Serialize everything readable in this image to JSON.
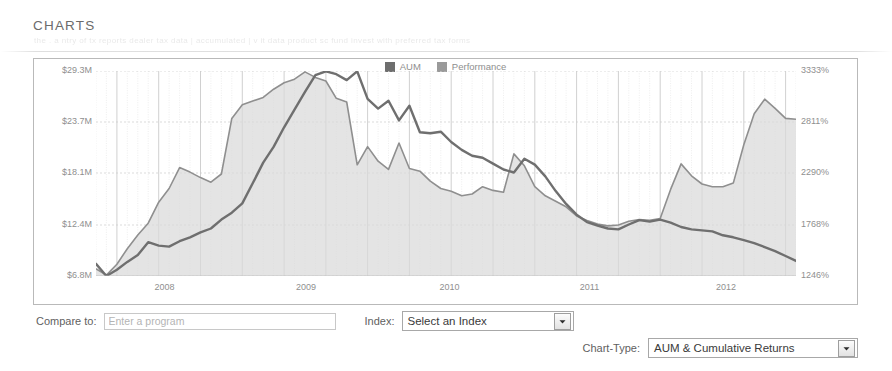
{
  "page": {
    "title": "CHARTS",
    "ghost_text": "the  .  a  ntry   of tx  reports       dealer tax data | accumulated   | v  it  data product sc        fund          invest with preferred tax forms"
  },
  "chart_data": {
    "type": "area",
    "title": "",
    "xlabel": "",
    "ylabel": "",
    "grid": true,
    "legend_position": "top-center",
    "colors": {
      "aum": "#8f8f8f",
      "performance": "#6f6f6f",
      "aum_fill": "#d9d9d9"
    },
    "legend": [
      {
        "name": "AUM",
        "color": "#6e6e6e"
      },
      {
        "name": "Performance",
        "color": "#9a9a9a"
      }
    ],
    "y_left": {
      "label": "AUM",
      "ticks": [
        "$6.8M",
        "$12.4M",
        "$18.1M",
        "$23.7M",
        "$29.3M"
      ],
      "tick_values": [
        6.8,
        12.4,
        18.1,
        23.7,
        29.3
      ],
      "ylim": [
        6.8,
        29.3
      ],
      "unit": "M"
    },
    "y_right": {
      "label": "Cumulative Returns",
      "ticks": [
        "1246%",
        "1768%",
        "2290%",
        "2811%",
        "3333%"
      ],
      "tick_values": [
        1246,
        1768,
        2290,
        2811,
        3333
      ],
      "ylim": [
        1246,
        3333
      ],
      "unit": "%"
    },
    "x": {
      "ticks": [
        "2008",
        "2009",
        "2010",
        "2011",
        "2012"
      ],
      "ticks_at": [
        0.098,
        0.3,
        0.505,
        0.705,
        0.9
      ]
    },
    "series": [
      {
        "name": "AUM",
        "axis": "left",
        "fill": true,
        "values": [
          7.6,
          6.9,
          8.1,
          9.8,
          11.3,
          12.6,
          14.9,
          16.4,
          18.7,
          18.2,
          17.6,
          17.1,
          18.0,
          24.1,
          25.6,
          26.0,
          26.4,
          27.3,
          28.0,
          28.4,
          29.2,
          28.6,
          28.2,
          26.3,
          25.9,
          19.0,
          21.0,
          19.4,
          18.5,
          21.4,
          18.6,
          18.3,
          17.2,
          16.4,
          16.1,
          15.6,
          15.8,
          16.6,
          16.2,
          16.0,
          20.2,
          18.9,
          16.6,
          15.6,
          15.0,
          14.4,
          13.4,
          12.9,
          12.5,
          12.3,
          12.4,
          12.8,
          13.0,
          12.9,
          13.1,
          16.3,
          19.1,
          17.8,
          16.9,
          16.6,
          16.6,
          17.0,
          21.2,
          24.6,
          26.2,
          25.2,
          24.1,
          24.0
        ]
      },
      {
        "name": "Performance",
        "axis": "right",
        "fill": false,
        "values": [
          1370,
          1246,
          1310,
          1390,
          1460,
          1590,
          1555,
          1545,
          1600,
          1640,
          1690,
          1730,
          1820,
          1890,
          1985,
          2190,
          2400,
          2560,
          2760,
          2940,
          3120,
          3290,
          3330,
          3300,
          3240,
          3330,
          3050,
          2950,
          3030,
          2830,
          2980,
          2710,
          2700,
          2715,
          2610,
          2530,
          2470,
          2450,
          2390,
          2330,
          2300,
          2440,
          2380,
          2260,
          2110,
          1980,
          1870,
          1795,
          1760,
          1730,
          1720,
          1770,
          1815,
          1800,
          1820,
          1790,
          1745,
          1720,
          1710,
          1700,
          1660,
          1640,
          1610,
          1580,
          1540,
          1500,
          1450,
          1400
        ]
      }
    ]
  },
  "controls": {
    "compare_label": "Compare to:",
    "compare_placeholder": "Enter a program",
    "compare_value": "",
    "index_label": "Index:",
    "index_value": "Select an Index",
    "charttype_label": "Chart-Type:",
    "charttype_value": "AUM & Cumulative Returns"
  }
}
